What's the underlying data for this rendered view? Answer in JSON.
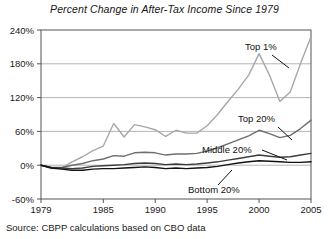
{
  "figure": {
    "title": "Percent Change in After-Tax Income Since 1979",
    "source": "Source: CBPP calculations based on CBO data"
  },
  "axes": {
    "y_ticks": [
      "240%",
      "180%",
      "120%",
      "60%",
      "0%",
      "-60%"
    ],
    "x_ticks": [
      "1979",
      "1985",
      "1990",
      "1995",
      "2000",
      "2005"
    ]
  },
  "labels": {
    "top1": "Top 1%",
    "top20": "Top 20%",
    "middle20": "Middle 20%",
    "bottom20": "Bottom 20%"
  },
  "chart_data": {
    "type": "line",
    "title": "Percent Change in After-Tax Income Since 1979",
    "xlabel": "",
    "ylabel": "",
    "xlim": [
      1979,
      2005
    ],
    "ylim": [
      -60,
      240
    ],
    "ytick_values": [
      240,
      180,
      120,
      60,
      0,
      -60
    ],
    "ytick_labels": [
      "240%",
      "180%",
      "120%",
      "60%",
      "0%",
      "-60%"
    ],
    "xtick_values": [
      1979,
      1985,
      1990,
      1995,
      2000,
      2005
    ],
    "xtick_labels": [
      "1979",
      "1985",
      "1990",
      "1995",
      "2000",
      "2005"
    ],
    "grid": "horizontal",
    "legend": "inline-annotations",
    "x": [
      1979,
      1980,
      1981,
      1982,
      1983,
      1984,
      1985,
      1986,
      1987,
      1988,
      1989,
      1990,
      1991,
      1992,
      1993,
      1994,
      1995,
      1996,
      1997,
      1998,
      1999,
      2000,
      2001,
      2002,
      2003,
      2004,
      2005
    ],
    "series": [
      {
        "name": "Top 1%",
        "color": "#a8a8a8",
        "values": [
          0,
          -6,
          -5,
          6,
          15,
          26,
          34,
          74,
          50,
          72,
          68,
          63,
          51,
          62,
          57,
          57,
          70,
          90,
          113,
          135,
          160,
          198,
          160,
          113,
          130,
          181,
          228
        ]
      },
      {
        "name": "Top 20%",
        "color": "#6e6e6e",
        "values": [
          0,
          -4,
          -4,
          0,
          3,
          8,
          11,
          17,
          16,
          22,
          23,
          22,
          18,
          20,
          20,
          21,
          25,
          31,
          38,
          45,
          52,
          62,
          56,
          49,
          53,
          65,
          80
        ]
      },
      {
        "name": "Middle 20%",
        "color": "#3c3c3c",
        "values": [
          0,
          -4,
          -5,
          -6,
          -5,
          -2,
          -1,
          0,
          1,
          3,
          4,
          3,
          1,
          2,
          1,
          2,
          4,
          6,
          9,
          12,
          15,
          18,
          16,
          14,
          15,
          18,
          21
        ]
      },
      {
        "name": "Bottom 20%",
        "color": "#111111",
        "values": [
          0,
          -5,
          -7,
          -9,
          -9,
          -7,
          -6,
          -6,
          -5,
          -4,
          -3,
          -4,
          -6,
          -5,
          -6,
          -5,
          -4,
          -2,
          1,
          4,
          6,
          8,
          7,
          6,
          5,
          5,
          6
        ]
      }
    ]
  }
}
